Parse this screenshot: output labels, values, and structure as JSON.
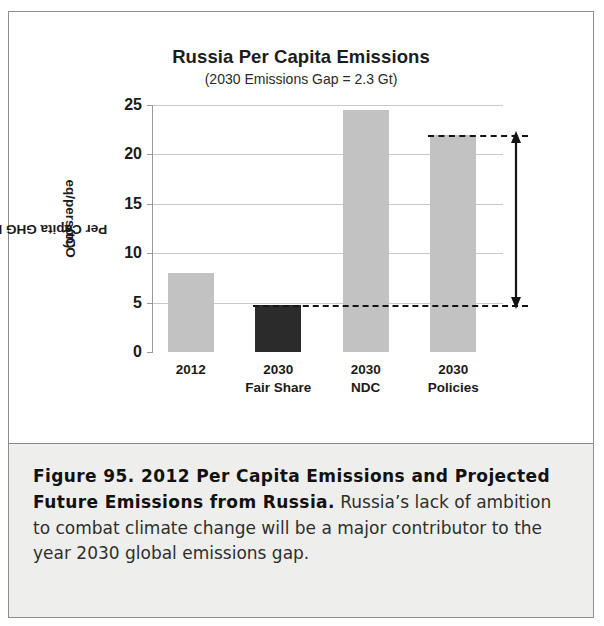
{
  "figure": {
    "title": "Russia Per Capita Emissions",
    "subtitle_prefix": "(2030 Emissions Gap  = 2.3 Gt)",
    "caption_bold": "Figure 95. 2012 Per Capita Emissions and Projected Future Emissions from Russia.",
    "caption_rest": " Russia’s lack of ambition to combat climate change will be a major contributor to the year 2030 global emissions gap."
  },
  "axis": {
    "y_title_line1": "Per Capita GHG Emissions",
    "y_title_line2_pre": "(tCO",
    "y_title_line2_sub": "2",
    "y_title_line2_post": "eq/person)",
    "y_ticks": [
      "0",
      "5",
      "10",
      "15",
      "20",
      "25"
    ]
  },
  "chart_data": {
    "type": "bar",
    "title": "Russia Per Capita Emissions",
    "subtitle": "(2030 Emissions Gap  = 2.3 Gt)",
    "xlabel": "",
    "ylabel": "Per Capita GHG Emissions (tCO2eq/person)",
    "ylim": [
      0,
      25
    ],
    "yticks": [
      0,
      5,
      10,
      15,
      20,
      25
    ],
    "grid": true,
    "legend": "none",
    "categories": [
      {
        "line1": "2012",
        "line2": ""
      },
      {
        "line1": "2030",
        "line2": "Fair Share"
      },
      {
        "line1": "2030",
        "line2": "NDC"
      },
      {
        "line1": "2030",
        "line2": "Policies"
      }
    ],
    "category_labels": [
      "2012",
      "2030 Fair Share",
      "2030 NDC",
      "2030 Policies"
    ],
    "values": [
      8.0,
      4.8,
      24.5,
      22.0
    ],
    "bar_colors": [
      "#c2c2c2",
      "#2b2b2b",
      "#c2c2c2",
      "#c2c2c2"
    ],
    "annotations": [
      {
        "type": "dashed-line",
        "y": 4.8,
        "note": "lower gap reference line (2030 Fair Share level)"
      },
      {
        "type": "dashed-line",
        "y": 22.0,
        "note": "upper gap reference line (2030 Policies level)"
      },
      {
        "type": "double-arrow",
        "y_from": 4.8,
        "y_to": 22.0,
        "note": "2030 emissions gap = 2.3 Gt"
      }
    ]
  },
  "colors": {
    "bar_light": "#c2c2c2",
    "bar_dark": "#2b2b2b",
    "grid": "#c9c9c9",
    "annotation": "#141414",
    "caption_bg": "#eeeeec"
  }
}
